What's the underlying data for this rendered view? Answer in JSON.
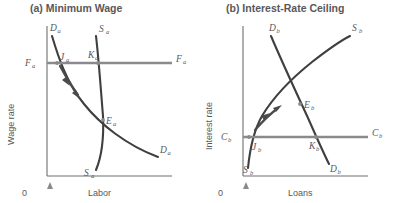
{
  "figure": {
    "background_color": "#ffffff",
    "curve_color": "#3f3f41",
    "control_line_color": "#8a8a8c",
    "axis_color": "#6e6e70",
    "text_color": "#58585a"
  },
  "panels": [
    {
      "id": "panel-a",
      "title": "(a) Minimum Wage",
      "y_axis_label": "Wage rate",
      "x_axis_label": "Labor",
      "origin_label": "0",
      "has_triangle_marker": true,
      "curves": [
        {
          "name": "demand-curve",
          "label_main": "D",
          "label_sub": "a",
          "label_top": "D",
          "label_bottom": "D",
          "role": "demand",
          "description": "downward sloping demand curve"
        },
        {
          "name": "supply-curve",
          "label_main": "S",
          "label_sub": "a",
          "role": "supply",
          "description": "steep upward sloping supply curve"
        }
      ],
      "control_line": {
        "name": "minimum-wage-line",
        "label_main": "F",
        "label_sub": "a",
        "role": "price floor",
        "description": "horizontal minimum wage floor above equilibrium"
      },
      "points": [
        {
          "name": "point-J",
          "label_main": "J",
          "label_sub": "a",
          "on": "demand curve at floor"
        },
        {
          "name": "point-K",
          "label_main": "K",
          "label_sub": "a",
          "on": "supply curve at floor"
        },
        {
          "name": "point-E",
          "label_main": "E",
          "label_sub": "a",
          "on": "equilibrium intersection"
        }
      ],
      "arrow": {
        "name": "adjustment-arrow",
        "direction": "down-right along demand curve"
      }
    },
    {
      "id": "panel-b",
      "title": "(b) Interest-Rate Ceiling",
      "y_axis_label": "Interest rate",
      "x_axis_label": "Loans",
      "origin_label": "0",
      "has_triangle_marker": true,
      "curves": [
        {
          "name": "demand-curve",
          "label_main": "D",
          "label_sub": "b",
          "role": "demand",
          "description": "downward sloping demand curve"
        },
        {
          "name": "supply-curve",
          "label_main": "S",
          "label_sub": "b",
          "role": "supply",
          "description": "upward sloping convex supply curve"
        }
      ],
      "control_line": {
        "name": "interest-rate-ceiling-line",
        "label_main": "C",
        "label_sub": "b",
        "role": "price ceiling",
        "description": "horizontal interest rate ceiling below equilibrium"
      },
      "points": [
        {
          "name": "point-J",
          "label_main": "J",
          "label_sub": "b",
          "on": "supply curve at ceiling"
        },
        {
          "name": "point-K",
          "label_main": "K",
          "label_sub": "b",
          "on": "demand curve at ceiling"
        },
        {
          "name": "point-E",
          "label_main": "E",
          "label_sub": "b",
          "on": "equilibrium intersection"
        }
      ],
      "arrow": {
        "name": "adjustment-arrow",
        "direction": "up-right along supply curve"
      }
    }
  ]
}
